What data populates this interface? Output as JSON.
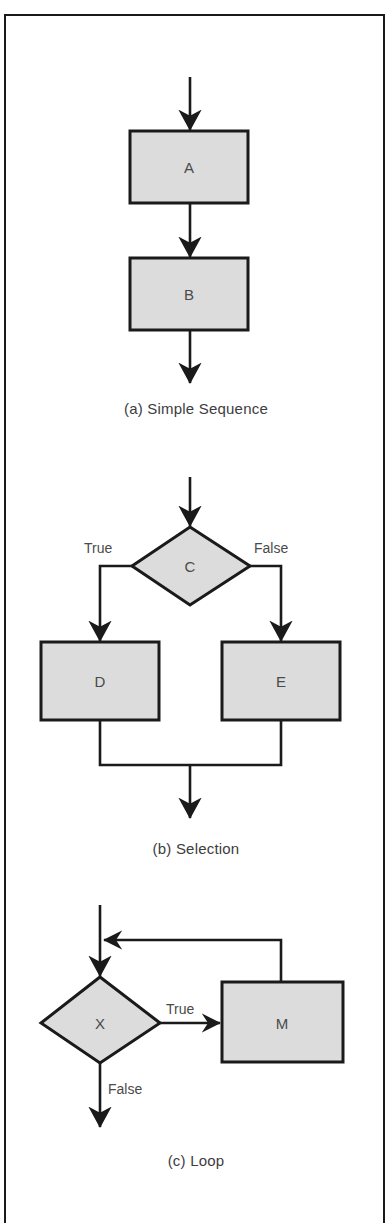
{
  "figure": {
    "cut_off_heading": "· ·",
    "border_color": "#1a1a1a",
    "node_fill": "#dcdcdc",
    "node_stroke": "#1a1a1a",
    "text_color": "#4a4a4a",
    "background": "#ffffff"
  },
  "panels": [
    {
      "id": "a",
      "caption": "(a) Simple Sequence",
      "nodes": [
        {
          "id": "A",
          "label": "A",
          "shape": "process"
        },
        {
          "id": "B",
          "label": "B",
          "shape": "process"
        }
      ],
      "edges": [
        {
          "from": "entry",
          "to": "A",
          "label": ""
        },
        {
          "from": "A",
          "to": "B",
          "label": ""
        },
        {
          "from": "B",
          "to": "exit",
          "label": ""
        }
      ]
    },
    {
      "id": "b",
      "caption": "(b) Selection",
      "nodes": [
        {
          "id": "C",
          "label": "C",
          "shape": "decision"
        },
        {
          "id": "D",
          "label": "D",
          "shape": "process"
        },
        {
          "id": "E",
          "label": "E",
          "shape": "process"
        }
      ],
      "edges": [
        {
          "from": "entry",
          "to": "C",
          "label": ""
        },
        {
          "from": "C",
          "to": "D",
          "label": "True"
        },
        {
          "from": "C",
          "to": "E",
          "label": "False"
        },
        {
          "from": "D",
          "to": "merge",
          "label": ""
        },
        {
          "from": "E",
          "to": "merge",
          "label": ""
        },
        {
          "from": "merge",
          "to": "exit",
          "label": ""
        }
      ]
    },
    {
      "id": "c",
      "caption": "(c) Loop",
      "nodes": [
        {
          "id": "X",
          "label": "X",
          "shape": "decision"
        },
        {
          "id": "M",
          "label": "M",
          "shape": "process"
        }
      ],
      "edges": [
        {
          "from": "entry",
          "to": "X",
          "label": ""
        },
        {
          "from": "X",
          "to": "M",
          "label": "True"
        },
        {
          "from": "M",
          "to": "X",
          "label": ""
        },
        {
          "from": "X",
          "to": "exit",
          "label": "False"
        }
      ]
    }
  ],
  "labels": {
    "node_a": "A",
    "node_b": "B",
    "node_c": "C",
    "node_d": "D",
    "node_e": "E",
    "node_x": "X",
    "node_m": "M",
    "true_b": "True",
    "false_b": "False",
    "true_c": "True",
    "false_c": "False",
    "caption_a": "(a) Simple Sequence",
    "caption_b": "(b) Selection",
    "caption_c": "(c) Loop"
  }
}
